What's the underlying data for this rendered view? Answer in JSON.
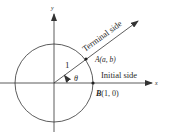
{
  "diagram": {
    "axes": {
      "x_label": "x",
      "y_label": "y"
    },
    "radius_label": "1",
    "angle_label": "θ",
    "terminal_side_label": "Terminal side",
    "initial_side_label": "Initial side",
    "point_a": {
      "name": "A",
      "coords": "(a, b)"
    },
    "point_b": {
      "name": "B",
      "coords": "(1, 0)"
    },
    "colors": {
      "stroke": "#333333",
      "text": "#2a2a2a",
      "background": "#ffffff"
    }
  }
}
